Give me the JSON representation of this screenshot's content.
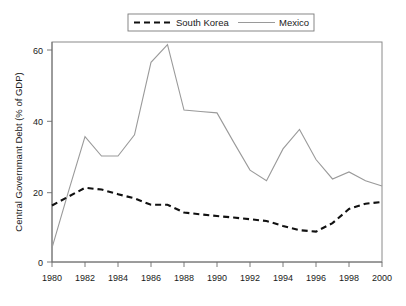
{
  "chart_data": {
    "type": "line",
    "title": "",
    "xlabel": "",
    "ylabel": "Central Governmant Debt (% of GDP)",
    "x": [
      1980,
      1981,
      1982,
      1983,
      1984,
      1985,
      1986,
      1987,
      1988,
      1989,
      1990,
      1991,
      1992,
      1993,
      1994,
      1995,
      1996,
      1997,
      1998,
      1999,
      2000
    ],
    "xlim": [
      1980,
      2000
    ],
    "ylim": [
      0,
      63
    ],
    "xticks": [
      1980,
      1982,
      1984,
      1986,
      1988,
      1990,
      1992,
      1994,
      1996,
      1998,
      2000
    ],
    "xtick_labels": [
      "1980",
      "1982",
      "1984",
      "1986",
      "1988",
      "1990",
      "1992",
      "1994",
      "1996",
      "1998",
      "2000"
    ],
    "yticks": [
      0,
      20,
      40,
      60
    ],
    "ytick_labels": [
      "0",
      "20",
      "40",
      "60"
    ],
    "grid": false,
    "legend_position": "top-center",
    "series": [
      {
        "name": "South Korea",
        "style": "dashed",
        "color": "#111111",
        "values": [
          16.0,
          18.5,
          21.0,
          20.5,
          19.2,
          18.0,
          16.2,
          16.2,
          14.0,
          13.5,
          13.0,
          12.6,
          12.1,
          11.6,
          10.2,
          9.0,
          8.6,
          11.0,
          15.0,
          16.5,
          17.0
        ]
      },
      {
        "name": "Mexico",
        "style": "solid",
        "color": "#9a9a9a",
        "values": [
          4.0,
          20.0,
          35.5,
          30.0,
          30.0,
          36.0,
          56.5,
          61.5,
          43.0,
          42.6,
          42.2,
          34.0,
          26.0,
          23.0,
          32.0,
          37.5,
          29.0,
          23.5,
          25.5,
          23.0,
          21.5
        ]
      }
    ]
  },
  "legend": {
    "entries": [
      {
        "label": "South Korea",
        "style": "dashed"
      },
      {
        "label": "Mexico",
        "style": "solid"
      }
    ]
  },
  "axes": {
    "y_title": "Central Governmant Debt (% of GDP)"
  },
  "colors": {
    "mexico_line": "#9a9a9a",
    "korea_line": "#111111",
    "frame": "#8a8a8a",
    "text": "#1a1a1a",
    "background": "#ffffff"
  }
}
